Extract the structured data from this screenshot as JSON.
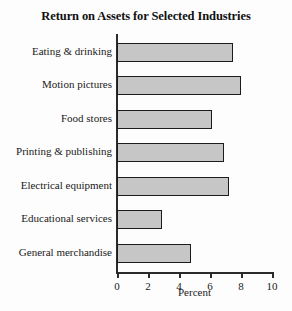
{
  "chart_data": {
    "type": "bar",
    "orientation": "horizontal",
    "title": "Return on Assets for Selected Industries",
    "xlabel": "Percent",
    "ylabel": "",
    "xlim": [
      0,
      10
    ],
    "xticks": [
      0,
      2,
      4,
      6,
      8,
      10
    ],
    "xtick_labels": [
      "0",
      "2",
      "4",
      "6",
      "8",
      "10"
    ],
    "grid": false,
    "legend": false,
    "categories": [
      "Eating & drinking",
      "Motion pictures",
      "Food stores",
      "Printing & publishing",
      "Electrical equipment",
      "Educational services",
      "General merchandise"
    ],
    "values": [
      7.5,
      8.0,
      6.1,
      6.9,
      7.2,
      2.9,
      4.8
    ],
    "bar_fill_color": "#c6c6c6",
    "bar_edge_color": "#1c1c1c",
    "axis_color": "#2b2b2b",
    "background_color": "#fdfdfd"
  }
}
